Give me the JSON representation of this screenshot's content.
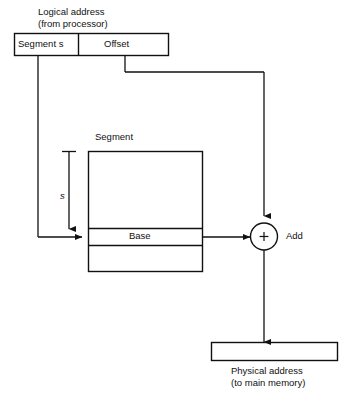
{
  "diagram": {
    "colors": {
      "stroke": "#111111",
      "background": "#ffffff",
      "text": "#111111"
    },
    "logical_address": {
      "caption_line1": "Logical address",
      "caption_line2": "(from processor)",
      "fields": [
        {
          "label": "Segment s",
          "name": "segment-field"
        },
        {
          "label": "Offset",
          "name": "offset-field"
        }
      ]
    },
    "segment_table": {
      "title": "Segment",
      "rows": [
        {
          "label": ""
        },
        {
          "label": "Base"
        },
        {
          "label": ""
        }
      ],
      "index_label": "s"
    },
    "adder": {
      "symbol": "+",
      "label": "Add"
    },
    "physical_address": {
      "value": "",
      "caption_line1": "Physical address",
      "caption_line2": "(to main memory)"
    }
  }
}
